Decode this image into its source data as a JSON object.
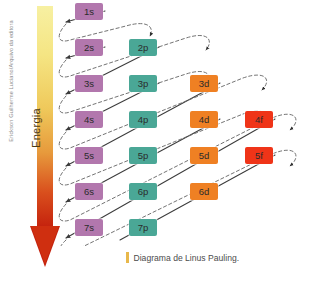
{
  "credit": {
    "text": "Erickson Guilherme Luciano/Arquivo da editora"
  },
  "energy_axis": {
    "label": "Energia",
    "direction": "down",
    "gradient_top_color": "#f5e98c",
    "gradient_bottom_color": "#c4210d"
  },
  "caption": {
    "bar_color": "#e8b84b",
    "text": "Diagrama de Linus Pauling."
  },
  "colors": {
    "s": "#b277ad",
    "p": "#4aa796",
    "d": "#ef8023",
    "f": "#ef3418",
    "arrow_solid": "#3c3c3c",
    "arrow_dashed": "#6b6b6b",
    "background": "#ffffff"
  },
  "chart_data": {
    "type": "diagram",
    "title": "Diagrama de Linus Pauling.",
    "ylabel": "Energia",
    "subshell_columns": [
      "s",
      "p",
      "d",
      "f"
    ],
    "orbitals": [
      {
        "label": "1s",
        "type": "s",
        "row": 1,
        "col": 0,
        "x": 75,
        "y": 3
      },
      {
        "label": "2s",
        "type": "s",
        "row": 2,
        "col": 0,
        "x": 75,
        "y": 39
      },
      {
        "label": "2p",
        "type": "p",
        "row": 2,
        "col": 1,
        "x": 129,
        "y": 39
      },
      {
        "label": "3s",
        "type": "s",
        "row": 3,
        "col": 0,
        "x": 75,
        "y": 75
      },
      {
        "label": "3p",
        "type": "p",
        "row": 3,
        "col": 1,
        "x": 129,
        "y": 75
      },
      {
        "label": "3d",
        "type": "d",
        "row": 3,
        "col": 2,
        "x": 190,
        "y": 75
      },
      {
        "label": "4s",
        "type": "s",
        "row": 4,
        "col": 0,
        "x": 75,
        "y": 111
      },
      {
        "label": "4p",
        "type": "p",
        "row": 4,
        "col": 1,
        "x": 129,
        "y": 111
      },
      {
        "label": "4d",
        "type": "d",
        "row": 4,
        "col": 2,
        "x": 190,
        "y": 111
      },
      {
        "label": "4f",
        "type": "f",
        "row": 4,
        "col": 3,
        "x": 245,
        "y": 111
      },
      {
        "label": "5s",
        "type": "s",
        "row": 5,
        "col": 0,
        "x": 75,
        "y": 147
      },
      {
        "label": "5p",
        "type": "p",
        "row": 5,
        "col": 1,
        "x": 129,
        "y": 147
      },
      {
        "label": "5d",
        "type": "d",
        "row": 5,
        "col": 2,
        "x": 190,
        "y": 147
      },
      {
        "label": "5f",
        "type": "f",
        "row": 5,
        "col": 3,
        "x": 245,
        "y": 147
      },
      {
        "label": "6s",
        "type": "s",
        "row": 6,
        "col": 0,
        "x": 75,
        "y": 183
      },
      {
        "label": "6p",
        "type": "p",
        "row": 6,
        "col": 1,
        "x": 129,
        "y": 183
      },
      {
        "label": "6d",
        "type": "d",
        "row": 6,
        "col": 2,
        "x": 190,
        "y": 183
      },
      {
        "label": "7s",
        "type": "s",
        "row": 7,
        "col": 0,
        "x": 75,
        "y": 219
      },
      {
        "label": "7p",
        "type": "p",
        "row": 7,
        "col": 1,
        "x": 129,
        "y": 219
      }
    ],
    "diagonals": [
      {
        "index": 1,
        "orbitals": [
          "1s"
        ]
      },
      {
        "index": 2,
        "orbitals": [
          "2s"
        ]
      },
      {
        "index": 3,
        "orbitals": [
          "2p",
          "3s"
        ]
      },
      {
        "index": 4,
        "orbitals": [
          "3p",
          "4s"
        ]
      },
      {
        "index": 5,
        "orbitals": [
          "3d",
          "4p",
          "5s"
        ]
      },
      {
        "index": 6,
        "orbitals": [
          "4d",
          "5p",
          "6s"
        ]
      },
      {
        "index": 7,
        "orbitals": [
          "4f",
          "5d",
          "6p",
          "7s"
        ]
      },
      {
        "index": 8,
        "orbitals": [
          "5f",
          "6d",
          "7p"
        ]
      }
    ],
    "filling_order": [
      "1s",
      "2s",
      "2p",
      "3s",
      "3p",
      "4s",
      "3d",
      "4p",
      "5s",
      "4d",
      "5p",
      "6s",
      "4f",
      "5d",
      "6p",
      "7s",
      "5f",
      "6d",
      "7p"
    ]
  }
}
